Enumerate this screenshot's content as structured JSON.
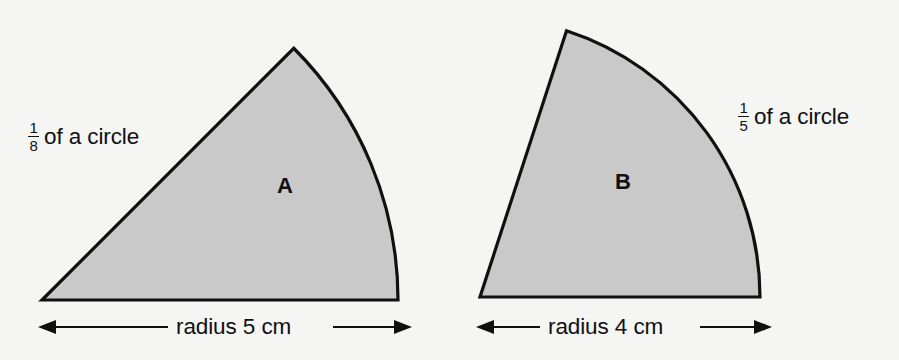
{
  "figure": {
    "background_color": "#f5f5f3",
    "fill_color": "#c9c9c9",
    "stroke_color": "#101010",
    "shapes": [
      {
        "id": "A",
        "letter_label": "A",
        "fraction_numerator": "1",
        "fraction_denominator": "8",
        "fraction_text": "of a circle",
        "dimension_text": "radius 5 cm",
        "radius_value": 5,
        "radius_unit": "cm",
        "fraction_of_circle": 0.125,
        "angle_degrees": 45
      },
      {
        "id": "B",
        "letter_label": "B",
        "fraction_numerator": "1",
        "fraction_denominator": "5",
        "fraction_text": "of a circle",
        "dimension_text": "radius 4 cm",
        "radius_value": 4,
        "radius_unit": "cm",
        "fraction_of_circle": 0.2,
        "angle_degrees": 72
      }
    ]
  }
}
